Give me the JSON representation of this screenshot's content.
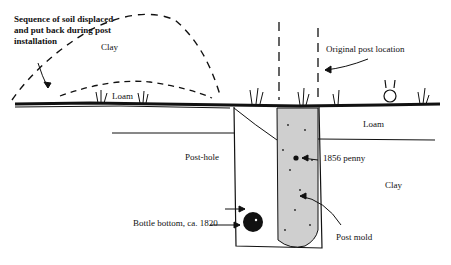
{
  "diagram": {
    "labels": {
      "sequence_note": "Sequence of soil displaced and put back during post installation",
      "clay_mound": "Clay",
      "loam_mound": "Loam",
      "original_post": "Original post location",
      "loam_right": "Loam",
      "post_hole": "Post-hole",
      "penny": "1856 penny",
      "clay_right": "Clay",
      "bottle": "Bottle bottom, ca. 1820",
      "post_mold": "Post mold"
    },
    "colors": {
      "ink": "#111111",
      "background": "#ffffff"
    }
  }
}
